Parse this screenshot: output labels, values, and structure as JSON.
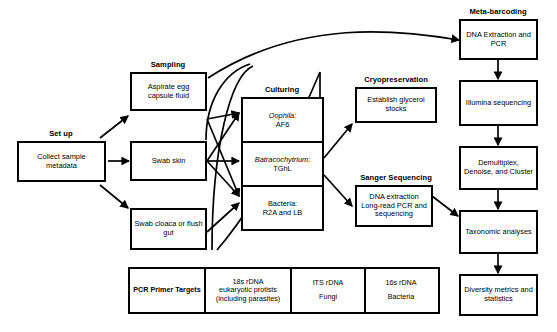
{
  "diagram": {
    "groups": {
      "setup": "Set up",
      "sampling": "Sampling",
      "culturing": "Culturing",
      "cryopreservation": "Cryopreservation",
      "sanger": "Sanger Sequencing",
      "metabarcoding": "Meta-barcoding"
    },
    "nodes": {
      "collect_metadata": "Collect sample metadata",
      "aspirate": "Aspirate egg capsule fluid",
      "swab_skin": "Swab skin",
      "swab_cloaca": "Swab cloaca or flush gut",
      "oophila": "Oophila:",
      "oophila_media": "AF6",
      "batracochytrium": "Batracochytrium:",
      "batracochytrium_media": "TGhL",
      "bacteria": "Bacteria:",
      "bacteria_media": "R2A and LB",
      "glycerol": "Establish glycerol stocks",
      "sanger_steps": "DNA extraction Long-read PCR and sequencing",
      "dna_extraction_pcr": "DNA Extraction and PCR",
      "illumina": "Illumina sequencing",
      "demultiplex": "Demultiplex, Denoise, and Cluster",
      "taxonomic": "Taxonomic analyses",
      "diversity": "Diversity metrics and statistics"
    },
    "primer_table": {
      "header": "PCR Primer Targets",
      "columns": [
        {
          "marker": "18s rDNA",
          "target": "eukaryotic protists (including parasites)"
        },
        {
          "marker": "ITS rDNA",
          "target": "Fungi"
        },
        {
          "marker": "16s rDNA",
          "target": "Bacteria"
        }
      ]
    },
    "style": {
      "stroke": "#000000",
      "background": "#ffffff"
    }
  }
}
